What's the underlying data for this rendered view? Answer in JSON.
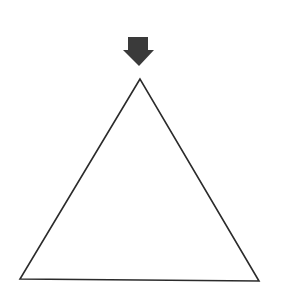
{
  "diagram": {
    "background": "#ffffff",
    "arrow": {
      "color": "#3a3a3a",
      "direction": "down",
      "points": "128,37 148,37 148,50 154,50 139,66 123,50 128,50"
    },
    "triangle": {
      "stroke": "#2b2b2b",
      "fill": "#ffffff",
      "stroke_width": 1.6,
      "points": "140,79 20,279 259,281"
    }
  }
}
